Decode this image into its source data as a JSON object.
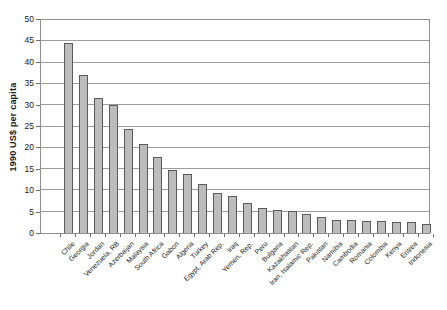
{
  "chart_data": {
    "type": "bar",
    "title": "",
    "xlabel": "",
    "ylabel": "1990 US$ per capita",
    "ylim": [
      0,
      50
    ],
    "yticks": [
      0,
      5,
      10,
      15,
      20,
      25,
      30,
      35,
      40,
      45,
      50
    ],
    "grid": "horizontal",
    "legend": "none",
    "categories": [
      "Chile",
      "Georgia",
      "Jordan",
      "Venezuela, RB",
      "Azerbaijan",
      "Malaysia",
      "South Africa",
      "Gabon",
      "Algeria",
      "Turkey",
      "Egypt, Arab Rep.",
      "Iraq",
      "Yemen, Rep.",
      "Peru",
      "Bulgaria",
      "Kazakhastan",
      "Iran, Isalamic Rep.",
      "Pakistan",
      "Namibia",
      "Cambodia",
      "Romania",
      "Colombia",
      "Kenya",
      "Eritrea",
      "Indonesia"
    ],
    "values": [
      44.6,
      37.1,
      31.6,
      30.0,
      24.5,
      20.8,
      17.8,
      14.9,
      13.9,
      11.5,
      9.5,
      8.6,
      7.0,
      5.9,
      5.5,
      5.2,
      4.4,
      3.7,
      3.0,
      3.0,
      2.9,
      2.9,
      2.7,
      2.5,
      2.0
    ],
    "colors": {
      "bar_fill": "#bcbcbc",
      "bar_border": "#5a5a5a",
      "gridline": "#9c9c9c",
      "frame": "#8f8f8f",
      "tick": "#6e6e6e",
      "text": "#1a1a1a",
      "background": "#ffffff"
    }
  }
}
